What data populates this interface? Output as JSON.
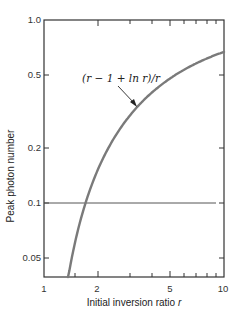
{
  "chart_data": {
    "type": "line",
    "title": "",
    "xlabel": "Initial inversion ratio r",
    "ylabel": "Peak photon number",
    "xscale": "log",
    "yscale": "log",
    "xlim": [
      1,
      10
    ],
    "ylim": [
      0.039,
      1.0
    ],
    "grid": false,
    "legend": null,
    "x_ticks": [
      {
        "value": 1,
        "label": "1"
      },
      {
        "value": 2,
        "label": "2"
      },
      {
        "value": 5,
        "label": "5"
      },
      {
        "value": 10,
        "label": "10"
      }
    ],
    "x_minor_ticks": [
      3,
      4,
      6,
      7,
      8,
      9
    ],
    "y_ticks": [
      {
        "value": 1.0,
        "label": "1.0"
      },
      {
        "value": 0.5,
        "label": "0.5"
      },
      {
        "value": 0.2,
        "label": "0.2"
      },
      {
        "value": 0.1,
        "label": "0.1"
      },
      {
        "value": 0.05,
        "label": "0.05"
      }
    ],
    "series": [
      {
        "name": "(r − 1 + ln r)/r",
        "color": "#7a7a7a",
        "x": [
          1.36,
          1.5,
          1.69,
          2.0,
          2.5,
          3.0,
          4.0,
          5.0,
          6.0,
          7.0,
          8.0,
          9.0,
          10.0
        ],
        "values": [
          0.039,
          0.063,
          0.098,
          0.153,
          0.233,
          0.3,
          0.403,
          0.478,
          0.535,
          0.58,
          0.615,
          0.645,
          0.67
        ]
      }
    ],
    "reference_lines": [
      {
        "orientation": "horizontal",
        "value": 0.1,
        "color": "#555555"
      }
    ],
    "annotations": [
      {
        "text": "(r − 1 + ln r)/r",
        "arrow_to": {
          "x": 3.2,
          "y": 0.33
        }
      }
    ]
  },
  "labels": {
    "x_axis": "Initial inversion ratio r",
    "x_axis_main": "Initial inversion ratio ",
    "x_axis_var": "r",
    "y_axis": "Peak photon number",
    "curve_annotation": "(r − 1 + ln r)/r",
    "tick_x_1": "1",
    "tick_x_2": "2",
    "tick_x_5": "5",
    "tick_x_10": "10",
    "tick_y_1": "1.0",
    "tick_y_05": "0.5",
    "tick_y_02": "0.2",
    "tick_y_01": "0.1",
    "tick_y_005": "0.05"
  }
}
